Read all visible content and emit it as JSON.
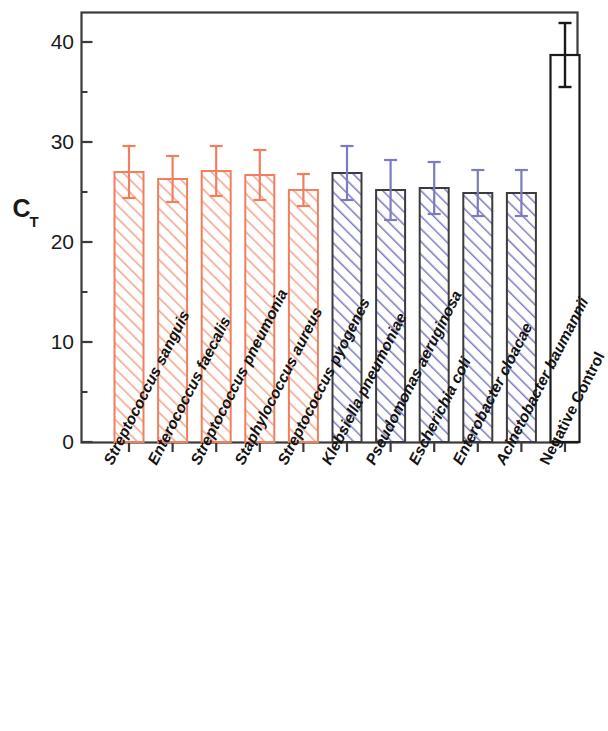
{
  "chart_data": {
    "type": "bar",
    "title": "",
    "subtitle": "",
    "xlabel": "",
    "ylabel": "C_T",
    "ylabel_display": "C",
    "ylabel_subscript": "T",
    "ylim": [
      0,
      43.5
    ],
    "ytick_labels": [
      "0",
      "10",
      "20",
      "30",
      "40"
    ],
    "ytick_values": [
      0,
      10,
      20,
      30,
      40
    ],
    "minor_ticks": true,
    "grid": false,
    "legend": "none",
    "categories": [
      "Streptococcus sanguis",
      "Enterococcus faecalis",
      "Streptococcus pneumonia",
      "Staphylococcus aureus",
      "Streptococcus pyogenes",
      "Klebsiella pneumoniae",
      "Pseudomonas aeruginosa",
      "Escherichia coli",
      "Enterobacter cloacae",
      "Acinetobacter baumannii",
      "Negative Control"
    ],
    "values": [
      27.0,
      26.3,
      27.1,
      26.7,
      25.2,
      26.9,
      25.2,
      25.4,
      24.9,
      24.9,
      38.7
    ],
    "errors": [
      2.6,
      2.3,
      2.5,
      2.5,
      1.6,
      2.7,
      3.0,
      2.6,
      2.3,
      2.3,
      3.2
    ],
    "bar_groups": [
      {
        "name": "gram-positive",
        "indices": [
          0,
          1,
          2,
          3,
          4
        ],
        "outline_color": "#F07F5F",
        "hatch_color": "#F2A98E",
        "error_color": "#F07F5F",
        "fill": "#FFFFFF"
      },
      {
        "name": "gram-negative",
        "indices": [
          5,
          6,
          7,
          8,
          9
        ],
        "outline_color": "#3C3C3C",
        "hatch_color": "#7B7BC0",
        "error_color": "#7B7BC0",
        "fill": "#FFFFFF"
      },
      {
        "name": "control",
        "indices": [
          10
        ],
        "outline_color": "#1A1A1A",
        "hatch_color": "none",
        "error_color": "#1A1A1A",
        "fill": "#FFFFFF"
      }
    ],
    "axis_color": "#3A3A3A",
    "background": "#FFFFFF"
  },
  "axis": {
    "y_title_main": "C",
    "y_title_sub": "T",
    "ticks": [
      {
        "label": "40",
        "value": 40
      },
      {
        "label": "30",
        "value": 30
      },
      {
        "label": "20",
        "value": 20
      },
      {
        "label": "10",
        "value": 10
      },
      {
        "label": "0",
        "value": 0
      }
    ]
  },
  "xlabels": [
    {
      "text": "Streptococcus sanguis",
      "italic": true
    },
    {
      "text": "Enterococcus faecalis",
      "italic": true
    },
    {
      "text": "Streptococcus pneumonia",
      "italic": true
    },
    {
      "text": "Staphylococcus aureus",
      "italic": true
    },
    {
      "text": "Streptococcus pyogenes",
      "italic": true
    },
    {
      "text": "Klebsiella pneumoniae",
      "italic": true
    },
    {
      "text": "Pseudomonas aeruginosa",
      "italic": true
    },
    {
      "text": "Escherichia coli",
      "italic": true
    },
    {
      "text": "Enterobacter cloacae",
      "italic": true
    },
    {
      "text": "Acinetobacter baumannii",
      "italic": true
    },
    {
      "text": "Negative Control",
      "italic": false
    }
  ]
}
